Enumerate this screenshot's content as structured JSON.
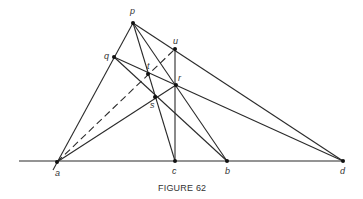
{
  "figure": {
    "caption": "FIGURE 62",
    "points": {
      "p": {
        "label": "p",
        "x": 133,
        "y": 23,
        "lx": 130,
        "ly": 14
      },
      "q": {
        "label": "q",
        "x": 114,
        "y": 57,
        "lx": 104,
        "ly": 56
      },
      "u": {
        "label": "u",
        "x": 175,
        "y": 49,
        "lx": 173,
        "ly": 44
      },
      "t": {
        "label": "t",
        "x": 148,
        "y": 74,
        "lx": 146,
        "ly": 68
      },
      "r": {
        "label": "r",
        "x": 176,
        "y": 85,
        "lx": 178,
        "ly": 80
      },
      "s": {
        "label": "s",
        "x": 155,
        "y": 97,
        "lx": 150,
        "ly": 107
      },
      "a": {
        "label": "a",
        "x": 57,
        "y": 162,
        "lx": 55,
        "ly": 175
      },
      "c": {
        "label": "c",
        "x": 175,
        "y": 161,
        "lx": 172,
        "ly": 174
      },
      "b": {
        "label": "b",
        "x": 227,
        "y": 161,
        "lx": 225,
        "ly": 174
      },
      "d": {
        "label": "d",
        "x": 343,
        "y": 161,
        "lx": 340,
        "ly": 174
      }
    },
    "lines": [
      {
        "from": "baseline-start",
        "to": "d",
        "style": "solid"
      },
      {
        "from": "a",
        "to": "p",
        "via": "q",
        "style": "solid"
      },
      {
        "from": "a",
        "to": "u",
        "via": "t",
        "style": "dashed"
      },
      {
        "from": "a",
        "to": "r",
        "via": "s",
        "style": "solid"
      },
      {
        "from": "p",
        "to": "c",
        "via": [
          "t",
          "s"
        ],
        "style": "solid"
      },
      {
        "from": "p",
        "to": "b",
        "via": "r",
        "style": "solid"
      },
      {
        "from": "p",
        "to": "d",
        "via": "u",
        "style": "solid"
      },
      {
        "from": "q",
        "to": "b",
        "via": "s",
        "style": "solid"
      },
      {
        "from": "q",
        "to": "d",
        "via": [
          "t",
          "r"
        ],
        "style": "solid"
      },
      {
        "from": "u",
        "to": "c",
        "via": "r",
        "style": "solid"
      }
    ]
  }
}
